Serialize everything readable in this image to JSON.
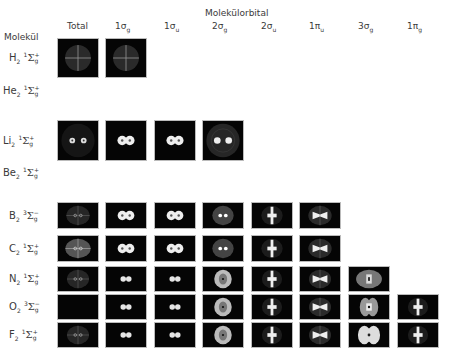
{
  "header": {
    "group_title": "Molekülorbital",
    "row_header": "Molekül",
    "columns": [
      {
        "id": "total",
        "label": "Total",
        "sub": ""
      },
      {
        "id": "1sg",
        "label": "1σ",
        "sub": "g"
      },
      {
        "id": "1su",
        "label": "1σ",
        "sub": "u"
      },
      {
        "id": "2sg",
        "label": "2σ",
        "sub": "g"
      },
      {
        "id": "2su",
        "label": "2σ",
        "sub": "u"
      },
      {
        "id": "1pu",
        "label": "1π",
        "sub": "u"
      },
      {
        "id": "3sg",
        "label": "3σ",
        "sub": "g"
      },
      {
        "id": "1pg",
        "label": "1π",
        "sub": "g"
      }
    ]
  },
  "rows": [
    {
      "molecule": "H",
      "n": "2",
      "mult": "1",
      "sym": "Σ",
      "par": "g",
      "sign": "+",
      "panels": [
        "sphere-cross",
        "sphere-cross"
      ]
    },
    {
      "molecule": "He",
      "n": "2",
      "mult": "1",
      "sym": "Σ",
      "par": "g",
      "sign": "+",
      "panels": []
    },
    {
      "molecule": "Li",
      "n": "2",
      "mult": "1",
      "sym": "Σ",
      "par": "g",
      "sign": "+",
      "panels": [
        "rings-dots",
        "two-blobs",
        "two-blobs",
        "rings-dots-bright"
      ]
    },
    {
      "molecule": "Be",
      "n": "2",
      "mult": "1",
      "sym": "Σ",
      "par": "g",
      "sign": "+",
      "panels": []
    },
    {
      "molecule": "B",
      "n": "2",
      "mult": "3",
      "sym": "Σ",
      "par": "g",
      "sign": "−",
      "panels": [
        "faint-sphere",
        "two-blobs",
        "two-blobs",
        "fuzzy-dots",
        "cross",
        "bowtie"
      ]
    },
    {
      "molecule": "C",
      "n": "2",
      "mult": "1",
      "sym": "Σ",
      "par": "g",
      "sign": "+",
      "panels": [
        "bright-sphere",
        "two-blobs",
        "two-blobs",
        "fuzzy-dots",
        "cross",
        "bowtie"
      ]
    },
    {
      "molecule": "N",
      "n": "2",
      "mult": "1",
      "sym": "Σ",
      "par": "g",
      "sign": "+",
      "panels": [
        "faint-sphere",
        "two-blobs-small",
        "two-blobs-small",
        "ring-disc",
        "cross",
        "bowtie",
        "oval-box"
      ]
    },
    {
      "molecule": "O",
      "n": "2",
      "mult": "3",
      "sym": "Σ",
      "par": "g",
      "sign": "−",
      "panels": [
        "empty",
        "two-blobs-small",
        "two-blobs-small",
        "ring-disc",
        "cross",
        "bowtie",
        "lobes",
        "cross"
      ]
    },
    {
      "molecule": "F",
      "n": "2",
      "mult": "1",
      "sym": "Σ",
      "par": "g",
      "sign": "+",
      "panels": [
        "faint-sphere",
        "two-blobs-small",
        "two-blobs-small",
        "ring-disc",
        "cross",
        "bowtie",
        "big-lobes",
        "cross"
      ]
    }
  ],
  "layout": {
    "col_x": [
      57,
      105,
      154,
      202,
      251,
      299,
      348,
      397
    ],
    "panel_w": 42,
    "row_y": [
      38,
      84,
      120,
      166,
      202,
      235,
      266,
      294,
      322
    ],
    "row_h": [
      40,
      0,
      41,
      0,
      27,
      27,
      26,
      26,
      26
    ]
  }
}
